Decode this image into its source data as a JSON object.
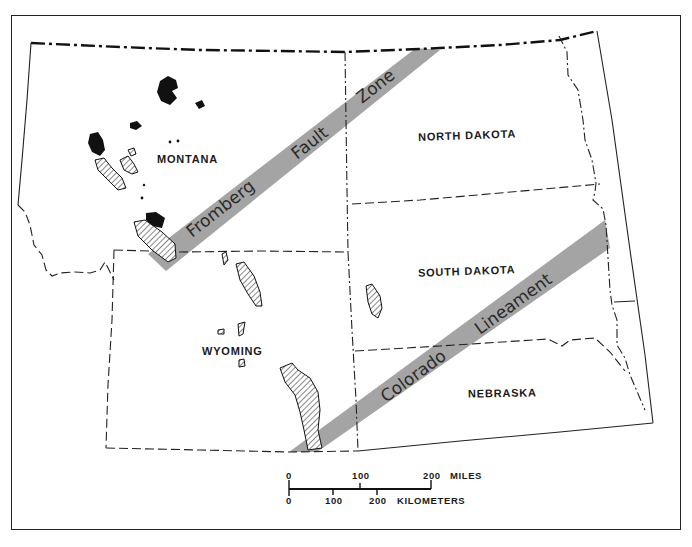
{
  "map": {
    "title": "",
    "states": [
      {
        "name": "MONTANA",
        "x": 192,
        "y": 163
      },
      {
        "name": "NORTH DAKOTA",
        "x": 472,
        "y": 134
      },
      {
        "name": "SOUTH DAKOTA",
        "x": 467,
        "y": 272
      },
      {
        "name": "WYOMING",
        "x": 236,
        "y": 352
      },
      {
        "name": "NEBRASKA",
        "x": 502,
        "y": 394
      }
    ],
    "zones": [
      {
        "name": "Fromberg Fault Zone",
        "words": [
          "Fromberg",
          "Fault",
          "Zone"
        ],
        "color": "#9c9c9c"
      },
      {
        "name": "Colorado Lineament",
        "words": [
          "Colorado",
          "Lineament"
        ],
        "color": "#9c9c9c"
      }
    ],
    "legend_symbols": {
      "black_fill": "solid uplift outcrops",
      "hatched": "hatched outcrops"
    }
  },
  "scale_bar": {
    "miles": {
      "ticks": [
        "0",
        "100",
        "200"
      ],
      "unit": "MILES"
    },
    "kilometers": {
      "ticks": [
        "0",
        "100",
        "200"
      ],
      "unit": "KILOMETERS"
    }
  }
}
